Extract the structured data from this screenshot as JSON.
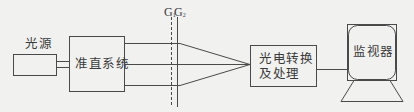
{
  "diagram": {
    "type": "optical-system-block-diagram",
    "colors": {
      "background": "#f1f1f0",
      "stroke": "#4a4a4a",
      "text": "#3a3a3a"
    },
    "nodes": {
      "light_source": {
        "label": "光源"
      },
      "collimator": {
        "label": "准直系统"
      },
      "photoelectric": {
        "line1": "光电转换",
        "line2": "及处理"
      },
      "monitor": {
        "label": "监视器"
      }
    },
    "gratings": {
      "g1": {
        "letter": "G",
        "sub": "1",
        "style": "dashed"
      },
      "g2": {
        "letter": "G",
        "sub": "2",
        "style": "solid"
      }
    },
    "edges": [
      {
        "from": "light_source",
        "to": "collimator",
        "style": "double-line"
      },
      {
        "from": "collimator",
        "to": "photoelectric",
        "style": "three converging beams through G1 G2"
      },
      {
        "from": "photoelectric",
        "to": "monitor",
        "style": "line"
      }
    ]
  }
}
